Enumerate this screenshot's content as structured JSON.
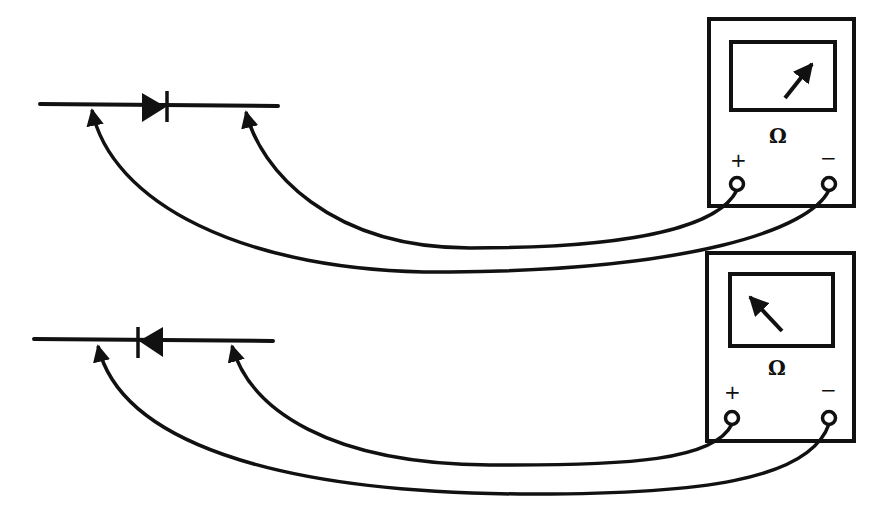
{
  "diagram": {
    "title": "",
    "colors": {
      "ink": "#111111",
      "background": "#ffffff"
    },
    "setups": [
      {
        "id": "forward-bias",
        "diode_orientation": "anode-left (triangle pointing right)",
        "meter": {
          "unit_label": "Ω",
          "plus_label": "+",
          "minus_label": "−",
          "needle_direction": "deflected right (low resistance)"
        },
        "connections": [
          "left diode lead ← meter − terminal",
          "right diode lead ← meter + terminal"
        ]
      },
      {
        "id": "reverse-bias",
        "diode_orientation": "cathode-left (triangle pointing left)",
        "meter": {
          "unit_label": "Ω",
          "plus_label": "+",
          "minus_label": "−",
          "needle_direction": "deflected left (high resistance)"
        },
        "connections": [
          "left diode lead ← meter − terminal",
          "right diode lead ← meter + terminal"
        ]
      }
    ]
  }
}
